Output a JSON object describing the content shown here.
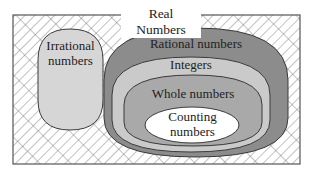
{
  "diagram": {
    "title": "Real Numbers",
    "sets": [
      {
        "id": "irrational",
        "label_lines": [
          "Irrational",
          "numbers"
        ],
        "fill": "#d6d6d6"
      },
      {
        "id": "rational",
        "label_lines": [
          "Rational numbers"
        ],
        "fill": "#8c8c8c"
      },
      {
        "id": "integers",
        "label_lines": [
          "Integers"
        ],
        "fill": "#cacaca"
      },
      {
        "id": "whole",
        "label_lines": [
          "Whole numbers"
        ],
        "fill": "#a9a9a9"
      },
      {
        "id": "counting",
        "label_lines": [
          "Counting",
          "numbers"
        ],
        "fill": "#ffffff"
      }
    ],
    "colors": {
      "stroke": "#3a3a3a",
      "hatch": "#555555",
      "frame": "#555555"
    }
  }
}
